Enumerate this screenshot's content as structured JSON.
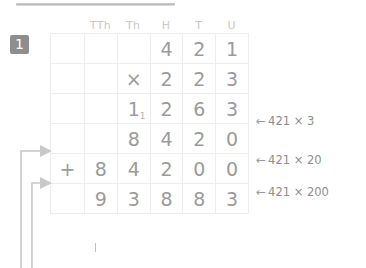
{
  "worksheet": {
    "question_number": "1",
    "top_rule": "decorative-rule"
  },
  "column_headings": [
    {
      "label": "TTh",
      "title": "ten-thousands"
    },
    {
      "label": "Th",
      "title": "thousands"
    },
    {
      "label": "H",
      "title": "hundreds"
    },
    {
      "label": "T",
      "title": "tens"
    },
    {
      "label": "U",
      "title": "units"
    }
  ],
  "calculation": {
    "rows": [
      {
        "name": "multiplicand-row",
        "sign": "",
        "digits": [
          "",
          "",
          "4",
          "2",
          "1"
        ],
        "tone": "dark"
      },
      {
        "name": "multiplier-row",
        "sign": "×",
        "digits": [
          "",
          "2",
          "2",
          "3"
        ],
        "digits_full": [
          "",
          "2",
          "2",
          "3"
        ],
        "tone": "dark"
      },
      {
        "name": "partial-product-1",
        "sign": "",
        "digits": [
          "",
          "1",
          "2",
          "6",
          "3"
        ],
        "carry": "1",
        "tone": "light"
      },
      {
        "name": "partial-product-2",
        "sign": "",
        "digits": [
          "",
          "8",
          "4",
          "2",
          "0"
        ],
        "tone": "light"
      },
      {
        "name": "partial-product-3",
        "sign": "+",
        "digits": [
          "8",
          "4",
          "2",
          "0",
          "0"
        ],
        "tone": "light"
      },
      {
        "name": "answer-row",
        "sign": "",
        "digits": [
          "9",
          "3",
          "8",
          "8",
          "3"
        ],
        "tone": "light"
      }
    ],
    "multiplicand": "421",
    "multiplier": "223",
    "answer": "93883"
  },
  "annotations": [
    {
      "arrow": "←",
      "text": "421 × 3"
    },
    {
      "arrow": "←",
      "text": "421 × 20"
    },
    {
      "arrow": "←",
      "text": "421 × 200"
    }
  ],
  "left_arrows": {
    "count": 2,
    "description": "carry-lines-pointing-into-partial-products"
  },
  "colors": {
    "dark_ink": "#3c3c3c",
    "light_ink": "#9b9b9b",
    "zero_ink": "#7a7a7a",
    "grid_line": "#ededed",
    "heavy_rule": "#4a4a4a",
    "heading_grey": "#c9c9c9",
    "badge_bg": "#8e8e8e",
    "arrow_grey": "#c6c6c6"
  }
}
